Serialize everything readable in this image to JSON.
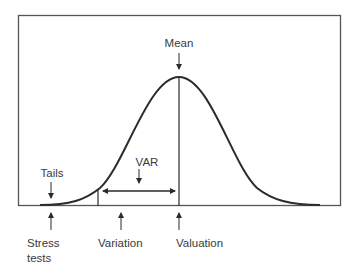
{
  "diagram": {
    "type": "normal-distribution",
    "labels": {
      "mean": "Mean",
      "var": "VAR",
      "tails": "Tails",
      "stress_line1": "Stress",
      "stress_line2": "tests",
      "variation": "Variation",
      "valuation": "Valuation"
    },
    "colors": {
      "line": "#2b2b2b",
      "frame": "#555555",
      "text": "#3a3a3a",
      "background": "#ffffff"
    }
  }
}
